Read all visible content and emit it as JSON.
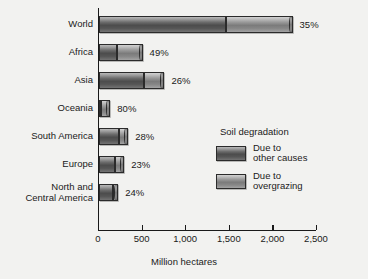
{
  "chart_data": {
    "type": "bar",
    "orientation": "horizontal",
    "stacked": true,
    "title": "",
    "xlabel": "Million hectares",
    "ylabel": "",
    "xlim": [
      0,
      2500
    ],
    "xticks": [
      0,
      500,
      1000,
      1500,
      2000,
      2500
    ],
    "xtick_labels": [
      "0",
      "500",
      "1,000",
      "1,500",
      "2,000",
      "2,500"
    ],
    "grid": false,
    "legend_position": "inside-right",
    "legend_title": "Soil degradation",
    "categories": [
      "World",
      "Africa",
      "Asia",
      "Oceania",
      "South America",
      "Europe",
      "North and\nCentral America"
    ],
    "series": [
      {
        "name": "Due to\nother causes",
        "key": "other",
        "values": [
          1460,
          210,
          515,
          25,
          225,
          185,
          160
        ]
      },
      {
        "name": "Due to\novergrazing",
        "key": "over",
        "values": [
          760,
          290,
          235,
          105,
          110,
          105,
          60
        ]
      }
    ],
    "totals": [
      2220,
      500,
      750,
      130,
      335,
      290,
      220
    ],
    "annotations": [
      "35%",
      "49%",
      "26%",
      "80%",
      "28%",
      "23%",
      "24%"
    ],
    "annotation_meaning": "share of degradation due to overgrazing"
  },
  "axis": {
    "title": "Million hectares"
  },
  "legend": {
    "title": "Soil degradation",
    "items": [
      {
        "label": "Due to\nother causes",
        "key": "other"
      },
      {
        "label": "Due to\novergrazing",
        "key": "over"
      }
    ]
  },
  "colors": {
    "background": "#f2f2f0",
    "axis": "#1a1a1a",
    "text": "#1a1a1a",
    "series_other": "#4c4c4c",
    "series_overgrazing": "#9a9a9a"
  }
}
